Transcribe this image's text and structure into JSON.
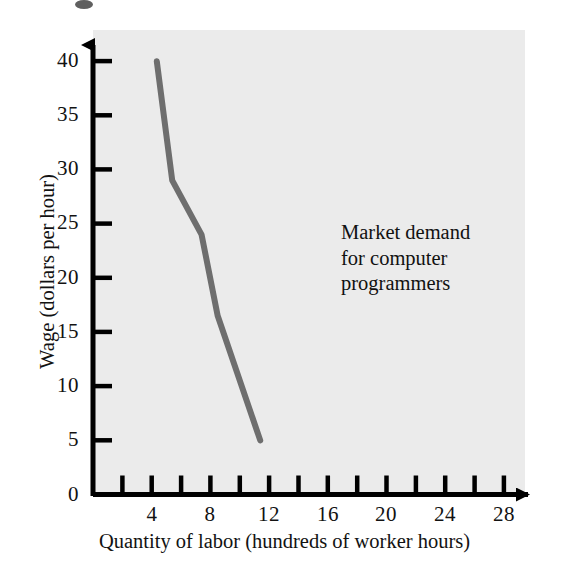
{
  "chart_data": {
    "type": "line",
    "title": "",
    "xlabel": "Quantity of labor (hundreds of worker hours)",
    "ylabel": "Wage (dollars per hour)",
    "xlim": [
      0,
      30
    ],
    "ylim": [
      0,
      42
    ],
    "grid": false,
    "legend_position": "inline-annotation",
    "series": [
      {
        "name": "Market demand for computer programmers",
        "color": "#6e6e6e",
        "line_width_px": 6,
        "points": [
          {
            "x": 8.7,
            "y": 40.0
          },
          {
            "x": 10.8,
            "y": 29.0
          },
          {
            "x": 14.8,
            "y": 24.0
          },
          {
            "x": 17.0,
            "y": 16.5
          },
          {
            "x": 22.8,
            "y": 5.0
          }
        ]
      }
    ],
    "annotations": [
      {
        "name": "market-demand-label",
        "text": "Market demand\nfor computer\nprogrammers",
        "x": 18.2,
        "y": 22.0
      }
    ],
    "y_ticks": [
      0,
      5,
      10,
      15,
      20,
      25,
      30,
      35,
      40
    ],
    "y_tick_labels": [
      "0",
      "5",
      "10",
      "15",
      "20",
      "25",
      "30",
      "35",
      "40"
    ],
    "x_ticks": [
      2,
      4,
      6,
      8,
      10,
      12,
      14,
      16,
      18,
      20,
      22,
      24,
      26,
      28
    ],
    "x_labeled_ticks": [
      4,
      8,
      12,
      16,
      20,
      24,
      28
    ],
    "x_tick_labels": [
      "4",
      "8",
      "12",
      "16",
      "20",
      "24",
      "28"
    ]
  },
  "style": {
    "plot_background": "#ebebeb",
    "page_background": "#ffffff",
    "axis_color": "#000000",
    "text_color": "#121212",
    "series_color": "#6e6e6e"
  }
}
